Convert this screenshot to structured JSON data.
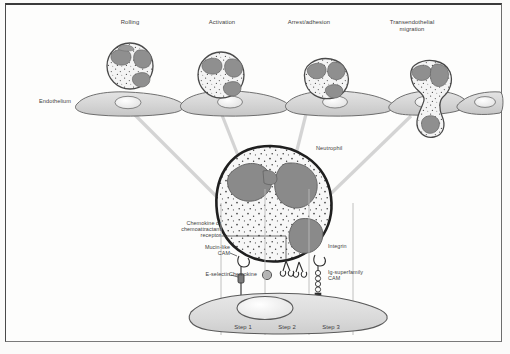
{
  "figure": {
    "title_stages": [
      {
        "id": "rolling",
        "label": "Rolling"
      },
      {
        "id": "activation",
        "label": "Activation"
      },
      {
        "id": "arrest",
        "label": "Arrest/adhesion"
      },
      {
        "id": "transmigration",
        "label": "Transendothelial\nmigration"
      }
    ],
    "endothelium_label": "Endothelium",
    "neutrophil_label": "Neutrophil",
    "molecule_labels": {
      "chemokine_receptor": "Chemokine or\nchemoattractant\nreceptor",
      "mucin_like_cam": "Mucin-like\nCAM",
      "e_selectin": "E-selectin",
      "chemokine": "Chemokine",
      "integrin": "Integrin",
      "ig_superfamily_cam": "Ig-superfamily\nCAM"
    },
    "steps": [
      {
        "id": "step-1",
        "label": "Step 1"
      },
      {
        "id": "step-2",
        "label": "Step 2"
      },
      {
        "id": "step-3",
        "label": "Step 3"
      }
    ],
    "colors": {
      "ink": "#3d3d3d",
      "cell_outline": "#555555",
      "cell_fill": "#d8d8d8",
      "nucleus_fill": "#8d8d8d",
      "cytoplasm_fill": "#f2f2f2",
      "leader_line": "#c9c9c9",
      "page_background": "#fdfdfc"
    }
  }
}
